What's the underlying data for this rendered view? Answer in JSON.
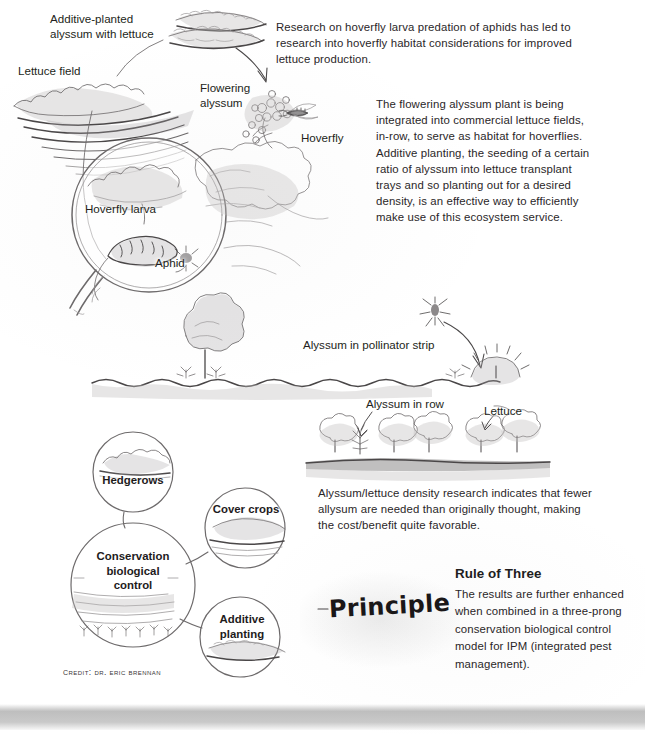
{
  "document": {
    "title": "Hoverfly habitat and conservation biological control infographic",
    "credit": "Credit: Dr. Eric Brennan",
    "medium": "pencil sketch infographic"
  },
  "labels": {
    "additive_planted": "Additive-planted\nalyssum with lettuce",
    "lettuce_field": "Lettuce field",
    "flowering_alyssum": "Flowering\nalyssum",
    "hoverfly": "Hoverfly",
    "hoverfly_larva": "Hoverfly larva",
    "aphid": "Aphid",
    "alyssum_pollinator_strip": "Alyssum in pollinator strip",
    "alyssum_in_row": "Alyssum in row",
    "lettuce": "Lettuce"
  },
  "paragraphs": {
    "research": "Research on hoverfly larva predation of aphids has led to research into hoverfly habitat considerations for improved lettuce production.",
    "flowering": "The flowering alyssum plant is being integrated into commercial lettuce fields, in-row, to serve as habitat for hoverflies. Additive planting, the seeding of a certain ratio of alyssum into lettuce transplant trays and so planting out for a desired density, is an effective way to efficiently make use of this ecosystem service.",
    "density": "Alyssum/lettuce density research indicates that fewer allysum are needed than originally thought, making the cost/benefit quite favorable."
  },
  "diagram_circles": {
    "hedgerows": "Hedgerows",
    "cover_crops": "Cover crops",
    "conservation": "Conservation\nbiological\ncontrol",
    "additive_planting": "Additive\nplanting"
  },
  "principle_block": {
    "principle_label": "Principle",
    "rule_title": "Rule of Three",
    "rule_body": "The results are further enhanced when combined in a three-prong conservation biological control model for IPM (integrated pest management)."
  },
  "colors": {
    "page_background": "#ffffff",
    "ink": "#231f20",
    "pencil_stroke": "#6d6a6b",
    "pencil_dark": "#4a4748",
    "shading": "#bfbdbe",
    "bottom_band": "#b0b0b0"
  }
}
